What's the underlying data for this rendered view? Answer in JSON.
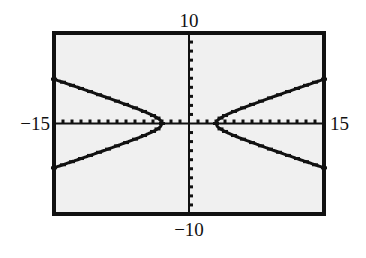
{
  "chart_data": {
    "type": "line",
    "title": "",
    "equation": "x^2/9 - y^2 = 1",
    "xlabel": "",
    "ylabel": "",
    "xlim": [
      -15,
      15
    ],
    "ylim": [
      -10,
      10
    ],
    "xscale": 1,
    "yscale": 1,
    "window_labels": {
      "xmin": "−15",
      "xmax": "15",
      "ymin": "−10",
      "ymax": "10"
    },
    "grid": false,
    "legend": "none",
    "series": [
      {
        "name": "right-upper branch",
        "points": [
          [
            3,
            0
          ],
          [
            3.5,
            0.6
          ],
          [
            4,
            0.88
          ],
          [
            5,
            1.33
          ],
          [
            6,
            1.73
          ],
          [
            7,
            2.11
          ],
          [
            8,
            2.47
          ],
          [
            9,
            2.83
          ],
          [
            10,
            3.18
          ],
          [
            11,
            3.53
          ],
          [
            12,
            3.87
          ],
          [
            13,
            4.22
          ],
          [
            14,
            4.56
          ],
          [
            15,
            4.9
          ]
        ]
      },
      {
        "name": "right-lower branch",
        "points": [
          [
            3,
            0
          ],
          [
            3.5,
            -0.6
          ],
          [
            4,
            -0.88
          ],
          [
            5,
            -1.33
          ],
          [
            6,
            -1.73
          ],
          [
            7,
            -2.11
          ],
          [
            8,
            -2.47
          ],
          [
            9,
            -2.83
          ],
          [
            10,
            -3.18
          ],
          [
            11,
            -3.53
          ],
          [
            12,
            -3.87
          ],
          [
            13,
            -4.22
          ],
          [
            14,
            -4.56
          ],
          [
            15,
            -4.9
          ]
        ]
      },
      {
        "name": "left-upper branch",
        "points": [
          [
            -3,
            0
          ],
          [
            -3.5,
            0.6
          ],
          [
            -4,
            0.88
          ],
          [
            -5,
            1.33
          ],
          [
            -6,
            1.73
          ],
          [
            -7,
            2.11
          ],
          [
            -8,
            2.47
          ],
          [
            -9,
            2.83
          ],
          [
            -10,
            3.18
          ],
          [
            -11,
            3.53
          ],
          [
            -12,
            3.87
          ],
          [
            -13,
            4.22
          ],
          [
            -14,
            4.56
          ],
          [
            -15,
            4.9
          ]
        ]
      },
      {
        "name": "left-lower branch",
        "points": [
          [
            -3,
            0
          ],
          [
            -3.5,
            -0.6
          ],
          [
            -4,
            -0.88
          ],
          [
            -5,
            -1.33
          ],
          [
            -6,
            -1.73
          ],
          [
            -7,
            -2.11
          ],
          [
            -8,
            -2.47
          ],
          [
            -9,
            -2.83
          ],
          [
            -10,
            -3.18
          ],
          [
            -11,
            -3.53
          ],
          [
            -12,
            -3.87
          ],
          [
            -13,
            -4.22
          ],
          [
            -14,
            -4.56
          ],
          [
            -15,
            -4.9
          ]
        ]
      }
    ],
    "colors": {
      "plot_background": "#f0f0f0",
      "frame": "#111111",
      "curve": "#111111",
      "axis": "#111111"
    }
  }
}
